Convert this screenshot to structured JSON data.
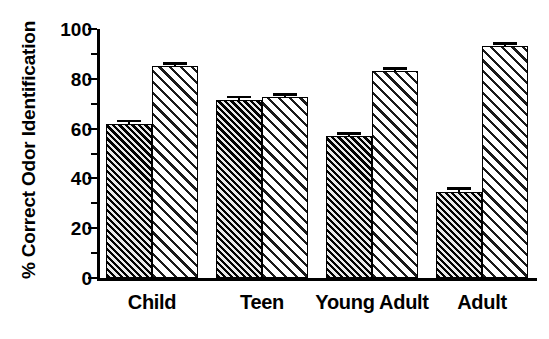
{
  "chart_data": {
    "type": "bar",
    "title": "",
    "subtitle": "",
    "xlabel": "",
    "ylabel": "% Correct Odor Identification",
    "categories": [
      "Child",
      "Teen",
      "Young Adult",
      "Adult"
    ],
    "series": [
      {
        "name": "Series 1 (dark hatched)",
        "pattern": "dense-diagonal-hatch-dark",
        "values": [
          62,
          71.5,
          57,
          34.5
        ],
        "errors": [
          1.5,
          1.5,
          1.5,
          2
        ]
      },
      {
        "name": "Series 2 (light hatched)",
        "pattern": "sparse-diagonal-hatch-light",
        "values": [
          85,
          72.5,
          83,
          93
        ],
        "errors": [
          1,
          1,
          1,
          1.5
        ]
      }
    ],
    "ylim": [
      0,
      100
    ],
    "ytick_labels": [
      "0",
      "20",
      "40",
      "60",
      "80",
      "100"
    ],
    "ytick_values": [
      0,
      20,
      40,
      60,
      80,
      100
    ],
    "yminor_values": [
      10,
      30,
      50,
      70,
      90
    ],
    "grid": false,
    "legend": "none",
    "error_bars": true,
    "colors": {
      "axis": "#000000",
      "series_dark": "#1a1a1a",
      "series_light": "#ffffff",
      "background": "#ffffff"
    }
  }
}
